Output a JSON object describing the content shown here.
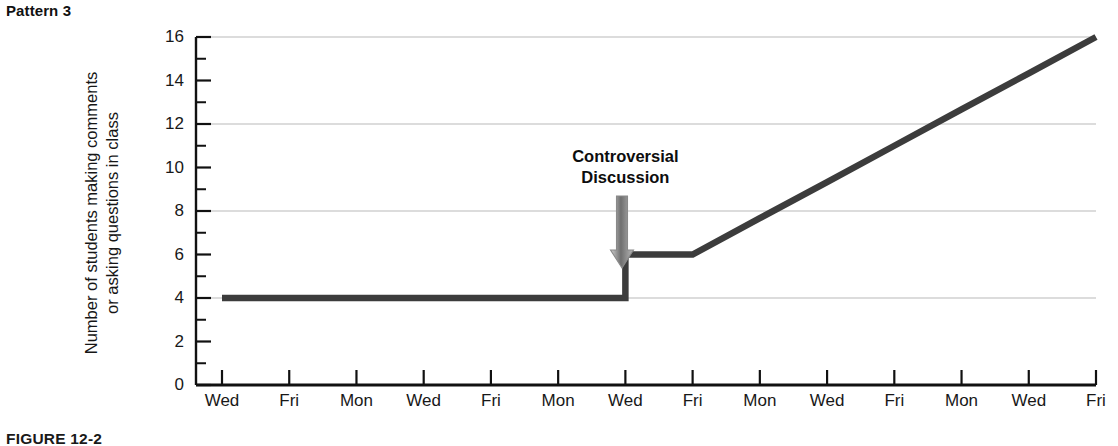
{
  "pattern_label": "Pattern 3",
  "figure_caption": "FIGURE 12-2",
  "annotation": {
    "line1": "Controversial",
    "line2": "Discussion",
    "arrow_icon": "down-arrow-icon",
    "arrow_color": "#9a9a9a"
  },
  "colors": {
    "line": "#3c3c3c",
    "axis": "#111111",
    "grid": "#b9b9b9",
    "text": "#161616",
    "background": "#ffffff"
  },
  "chart_data": {
    "type": "line",
    "title": "Pattern 3",
    "xlabel": "",
    "ylabel": "Number of students making comments or asking questions in class",
    "ylabel_line1": "Number of students making comments",
    "ylabel_line2": "or asking questions in class",
    "categories": [
      "Wed",
      "Fri",
      "Mon",
      "Wed",
      "Fri",
      "Mon",
      "Wed",
      "Fri",
      "Mon",
      "Wed",
      "Fri",
      "Mon",
      "Wed",
      "Fri"
    ],
    "x_tick_labels": [
      "Wed",
      "Fri",
      "Mon",
      "Wed",
      "Fri",
      "Mon",
      "Wed",
      "Fri",
      "Mon",
      "Wed",
      "Fri",
      "Mon",
      "Wed",
      "Fri"
    ],
    "y_tick_labels": [
      "0",
      "2",
      "4",
      "6",
      "8",
      "10",
      "12",
      "14",
      "16"
    ],
    "y_ticks": [
      0,
      2,
      4,
      6,
      8,
      10,
      12,
      14,
      16
    ],
    "ylim": [
      0,
      16
    ],
    "minor_y_ticks": [
      1,
      3,
      5,
      7,
      9,
      11,
      13,
      15
    ],
    "gridlines_y": [
      4,
      8,
      12,
      16
    ],
    "grid": true,
    "legend": "none",
    "series": [
      {
        "name": "Number of students making comments or asking questions in class",
        "values": [
          4,
          4,
          4,
          4,
          4,
          4,
          4,
          6,
          7.67,
          9.33,
          11,
          12.67,
          14.33,
          16
        ],
        "step_at_index": 6,
        "baseline_value": 4,
        "post_intervention_start": 6,
        "final_value": 16
      }
    ],
    "annotations": [
      {
        "text": "Controversial Discussion",
        "at_category": "Wed",
        "at_index": 6,
        "points_to_value": 6
      }
    ]
  }
}
